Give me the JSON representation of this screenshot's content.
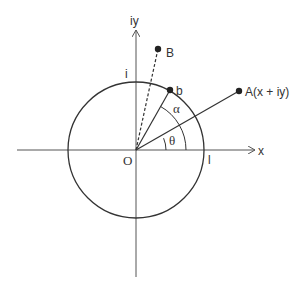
{
  "diagram": {
    "colors": {
      "stroke": "#333333",
      "axis": "#555555",
      "background": "#ffffff"
    },
    "axes": {
      "x_label": "x",
      "y_label": "iy",
      "origin_label": "O"
    },
    "unit_circle": {
      "top_label": "i",
      "right_label": "l"
    },
    "points": {
      "A": {
        "label": "A(x + iy)"
      },
      "B": {
        "label": "B"
      },
      "b": {
        "label": "b"
      }
    },
    "angles": {
      "theta": "θ",
      "alpha": "α"
    }
  }
}
